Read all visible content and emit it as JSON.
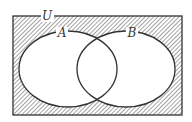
{
  "diagram": {
    "type": "venn",
    "universe": {
      "label": "U",
      "x": 13,
      "y": 16,
      "width": 169,
      "height": 99,
      "label_x": 47,
      "label_y": 20
    },
    "sets": [
      {
        "label": "A",
        "cx": 68,
        "cy": 69,
        "rx": 49,
        "ry": 38,
        "label_x": 61,
        "label_y": 37
      },
      {
        "label": "B",
        "cx": 126,
        "cy": 69,
        "rx": 49,
        "ry": 38,
        "label_x": 131,
        "label_y": 37
      }
    ],
    "shaded_region": "complement of (A ∪ B)",
    "colors": {
      "stroke": "#333333",
      "hatch": "#555555",
      "background": "#ffffff"
    }
  }
}
